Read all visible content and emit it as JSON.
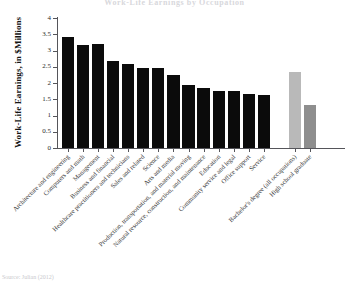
{
  "chart_data": {
    "type": "bar",
    "title": "Work-Life Earnings by Occupation",
    "xlabel": "",
    "ylabel": "Work-Life Earnings, in $Millions",
    "ylim": [
      0,
      4
    ],
    "ytick_labels": [
      "0",
      "0.5",
      "1",
      "1.5",
      "2",
      "2.5",
      "3",
      "3.5",
      "4"
    ],
    "ytick_values": [
      0,
      0.5,
      1,
      1.5,
      2,
      2.5,
      3,
      3.5,
      4
    ],
    "grid": false,
    "legend": "none",
    "categories": [
      "Architecture and engineering",
      "Computers and math",
      "Management",
      "Business and financial",
      "Healthcare practitioners and technicians",
      "Sales and related",
      "Science",
      "Arts and media",
      "Production, transportation, and material moving",
      "Natural resource, construction, and maintenance",
      "Education",
      "Community service and legal",
      "Office support",
      "Service",
      "Bachelor's degree (all occupations)",
      "High school graduate"
    ],
    "values": [
      3.42,
      3.18,
      3.19,
      2.67,
      2.59,
      2.47,
      2.47,
      2.26,
      1.95,
      1.85,
      1.76,
      1.76,
      1.65,
      1.63,
      2.33,
      1.33
    ],
    "bar_colors": [
      "#0b0b0b",
      "#0b0b0b",
      "#0b0b0b",
      "#0b0b0b",
      "#0b0b0b",
      "#0b0b0b",
      "#0b0b0b",
      "#0b0b0b",
      "#0b0b0b",
      "#0b0b0b",
      "#0b0b0b",
      "#0b0b0b",
      "#0b0b0b",
      "#0b0b0b",
      "#b9b9b9",
      "#8e8e8e"
    ],
    "reference_group_start_index": 14
  },
  "source_note": "Source: Julian (2012)"
}
